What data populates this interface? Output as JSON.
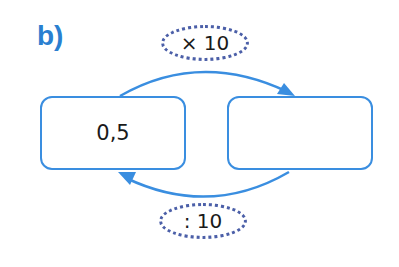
{
  "exercise": {
    "label": "b)"
  },
  "boxes": {
    "left": {
      "value": "0,5"
    },
    "right": {
      "value": ""
    }
  },
  "operations": {
    "forward": {
      "label": "× 10",
      "direction": "left-to-right",
      "position": "top"
    },
    "backward": {
      "label": ": 10",
      "direction": "right-to-left",
      "position": "bottom"
    }
  },
  "colors": {
    "accent": "#3a8ee0",
    "label": "#2a7fd0",
    "oval_border": "#4b5fa8",
    "text": "#1a1a1a"
  }
}
